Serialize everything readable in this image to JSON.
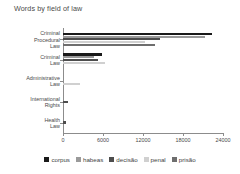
{
  "chart_data": {
    "type": "bar",
    "orientation": "horizontal",
    "title": "Words by field of law",
    "xlabel": "",
    "ylabel": "",
    "xlim": [
      0,
      24000
    ],
    "xticks": [
      "0",
      "6000",
      "12000",
      "18000",
      "24000"
    ],
    "xtick_values": [
      0,
      6000,
      12000,
      18000,
      24000
    ],
    "grid": false,
    "legend_position": "bottom",
    "categories": [
      "Criminal Procedural Law",
      "Criminal Law",
      "Administrative Law",
      "International Rights",
      "Health Law"
    ],
    "category_lines": [
      [
        "Criminal",
        "Procedural",
        "Law"
      ],
      [
        "Criminal",
        "Law"
      ],
      [
        "Administrative",
        "Law"
      ],
      [
        "International",
        "Rights"
      ],
      [
        "Health",
        "Law"
      ]
    ],
    "series": [
      {
        "name": "corpus",
        "color": "#1a1a1a",
        "values": [
          22400,
          5900,
          0,
          0,
          0
        ]
      },
      {
        "name": "habeas",
        "color": "#9a9a9a",
        "values": [
          21300,
          4700,
          0,
          0,
          0
        ]
      },
      {
        "name": "decisão",
        "color": "#4d4d4d",
        "values": [
          14500,
          5200,
          0,
          700,
          450
        ]
      },
      {
        "name": "penal",
        "color": "#d0d0d0",
        "values": [
          12300,
          6300,
          2500,
          0,
          0
        ]
      },
      {
        "name": "prisão",
        "color": "#6e6e6e",
        "values": [
          13800,
          0,
          0,
          0,
          0
        ]
      }
    ]
  }
}
